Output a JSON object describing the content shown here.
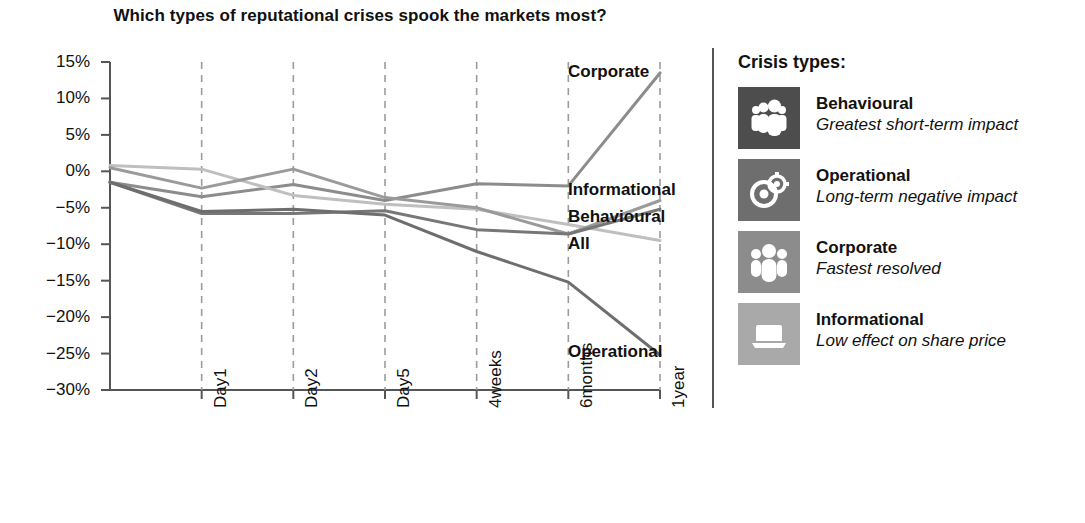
{
  "title": "Which types of reputational crises spook the markets most?",
  "legend": {
    "heading": "Crisis types:",
    "items": [
      {
        "name": "Behavioural",
        "desc": "Greatest short-term impact",
        "icon": "group-of-people-icon",
        "color": "#4d4d4d"
      },
      {
        "name": "Operational",
        "desc": "Long-term negative impact",
        "icon": "gears-circles-icon",
        "color": "#6e6e6e"
      },
      {
        "name": "Corporate",
        "desc": "Fastest resolved",
        "icon": "three-people-icon",
        "color": "#8c8c8c"
      },
      {
        "name": "Informational",
        "desc": "Low effect on share price",
        "icon": "laptop-icon",
        "color": "#a9a9a9"
      }
    ]
  },
  "series_labels": [
    {
      "text": "Corporate",
      "x": 568,
      "y": 22
    },
    {
      "text": "Informational",
      "x": 568,
      "y": 140
    },
    {
      "text": "Behavioural",
      "x": 568,
      "y": 167
    },
    {
      "text": "All",
      "x": 568,
      "y": 194
    },
    {
      "text": "Operational",
      "x": 568,
      "y": 302
    }
  ],
  "chart_data": {
    "type": "line",
    "title": "Which types of reputational crises spook the markets most?",
    "xlabel": "",
    "ylabel": "",
    "categories": [
      "Event",
      "Day1",
      "Day2",
      "Day5",
      "4weeks",
      "6months",
      "1year"
    ],
    "tick_labels": [
      "Day1",
      "Day2",
      "Day5",
      "4weeks",
      "6months",
      "1year"
    ],
    "ylim": [
      -30,
      15
    ],
    "yticks": [
      15,
      10,
      5,
      0,
      -5,
      -10,
      -15,
      -20,
      -25,
      -30
    ],
    "ytick_labels": [
      "15%",
      "10%",
      "5%",
      "0%",
      "−5%",
      "−10%",
      "−15%",
      "−20%",
      "−25%",
      "−30%"
    ],
    "grid": "vertical-dashed",
    "legend_position": "inline-right",
    "series": [
      {
        "name": "Corporate",
        "color": "#8c8c8c",
        "values": [
          -1.5,
          -3.5,
          -1.8,
          -4.0,
          -1.7,
          -2.0,
          13.5
        ]
      },
      {
        "name": "Informational",
        "color": "#bfbfbf",
        "values": [
          0.8,
          0.3,
          -3.3,
          -4.5,
          -5.2,
          -7.3,
          -9.5
        ]
      },
      {
        "name": "Behavioural",
        "color": "#9a9a9a",
        "values": [
          0.5,
          -2.3,
          0.3,
          -3.6,
          -5.0,
          -8.6,
          -4.0
        ]
      },
      {
        "name": "All",
        "color": "#777777",
        "values": [
          -1.5,
          -5.8,
          -5.8,
          -5.4,
          -8.0,
          -8.6,
          -5.2
        ]
      },
      {
        "name": "Operational",
        "color": "#6e6e6e",
        "values": [
          -1.5,
          -5.5,
          -5.2,
          -6.0,
          -11.0,
          -15.2,
          -25.2
        ]
      }
    ]
  }
}
